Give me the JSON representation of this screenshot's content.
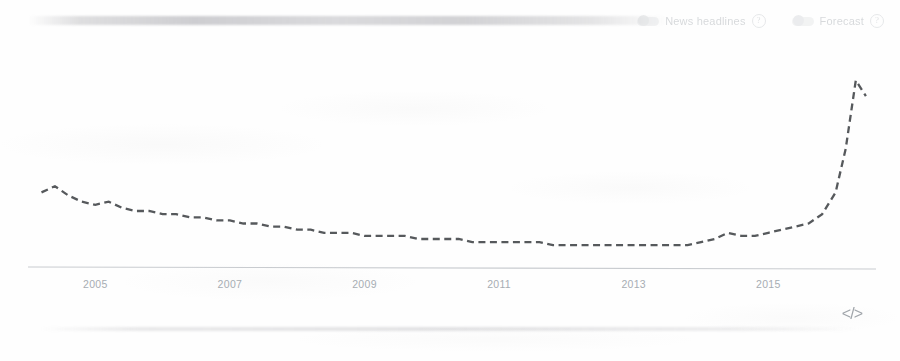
{
  "header": {
    "controls": [
      {
        "name": "news-headlines",
        "label": "News headlines",
        "help": "?",
        "state": "off"
      },
      {
        "name": "forecast",
        "label": "Forecast",
        "help": "?",
        "state": "off"
      }
    ]
  },
  "footer": {
    "embed_icon": "</>",
    "embed_icon_name": "embed-code-icon"
  },
  "colors": {
    "line": "#56595c",
    "axis": "#c9ccd0",
    "tick_label": "#a7adb3",
    "background": "#fefefe"
  },
  "chart_data": {
    "type": "line",
    "title": "",
    "subtitle": "",
    "xlabel": "",
    "ylabel": "",
    "grid": false,
    "legend": "none",
    "line_style": "dashed",
    "xlim": [
      2004.0,
      2016.6
    ],
    "ylim": [
      0,
      100
    ],
    "tick_labels": [
      "2005",
      "2007",
      "2009",
      "2011",
      "2013",
      "2015"
    ],
    "ticks": [
      2005,
      2007,
      2009,
      2011,
      2013,
      2015
    ],
    "series": [
      {
        "name": "Interest over time",
        "x": [
          2004.2,
          2004.4,
          2004.6,
          2004.8,
          2005.0,
          2005.2,
          2005.4,
          2005.6,
          2005.8,
          2006.0,
          2006.2,
          2006.4,
          2006.6,
          2006.8,
          2007.0,
          2007.2,
          2007.4,
          2007.6,
          2007.8,
          2008.0,
          2008.2,
          2008.4,
          2008.6,
          2008.8,
          2009.0,
          2009.2,
          2009.4,
          2009.6,
          2009.8,
          2010.0,
          2010.2,
          2010.4,
          2010.6,
          2010.8,
          2011.0,
          2011.2,
          2011.4,
          2011.6,
          2011.8,
          2012.0,
          2012.2,
          2012.4,
          2012.6,
          2012.8,
          2013.0,
          2013.2,
          2013.4,
          2013.6,
          2013.8,
          2014.0,
          2014.2,
          2014.4,
          2014.6,
          2014.8,
          2015.0,
          2015.2,
          2015.4,
          2015.6,
          2015.8,
          2016.0,
          2016.15,
          2016.3,
          2016.45
        ],
        "values": [
          24,
          26,
          23,
          21,
          20,
          21,
          19,
          18,
          18,
          17,
          17,
          16,
          16,
          15,
          15,
          14,
          14,
          13,
          13,
          12,
          12,
          11,
          11,
          11,
          10,
          10,
          10,
          10,
          9,
          9,
          9,
          9,
          8,
          8,
          8,
          8,
          8,
          8,
          7,
          7,
          7,
          7,
          7,
          7,
          7,
          7,
          7,
          7,
          7,
          8,
          9,
          11,
          10,
          10,
          11,
          12,
          13,
          14,
          17,
          24,
          38,
          60,
          55
        ]
      }
    ]
  }
}
